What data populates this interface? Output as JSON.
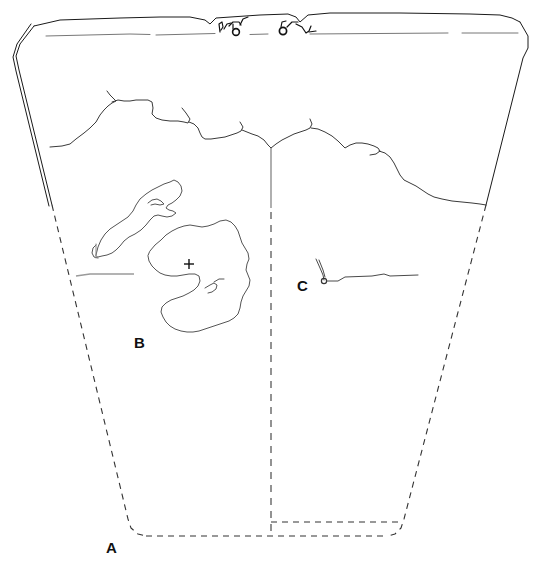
{
  "figure": {
    "type": "archaeological-section-drawing",
    "title": "",
    "background_color": "#ffffff",
    "width": 536,
    "height": 566,
    "line_color": "#1a1a1a",
    "faint_line_color": "#808080",
    "dashed_line_color": "#333333"
  },
  "labels": [
    {
      "id": "label-a",
      "text": "A",
      "x": 106,
      "y": 553
    },
    {
      "id": "label-b",
      "text": "B",
      "x": 134,
      "y": 348
    },
    {
      "id": "label-c",
      "text": "C",
      "x": 297,
      "y": 291
    }
  ],
  "markers": [
    {
      "id": "center-cross",
      "symbol": "+",
      "x": 189,
      "y": 264
    }
  ],
  "regions": [
    {
      "id": "trench-outline",
      "style": "solid-upper-dashed-lower",
      "description": "trapezoidal trench section outline"
    },
    {
      "id": "upper-band",
      "style": "solid",
      "description": "topsoil band with faint horizontal lines"
    },
    {
      "id": "stratum-boundary",
      "style": "solid",
      "description": "irregular jagged stratigraphic contact line"
    },
    {
      "id": "feature-b-outline",
      "style": "solid",
      "description": "irregular closed feature outline labelled B"
    },
    {
      "id": "feature-c-line",
      "style": "solid",
      "description": "thin horizontal feature with hook labelled C"
    },
    {
      "id": "baulk-centre-line",
      "style": "solid-then-dashed",
      "description": "vertical centre line"
    },
    {
      "id": "trench-base",
      "style": "dashed",
      "description": "projected trench base"
    },
    {
      "id": "sump-step",
      "style": "dashed",
      "description": "dashed rectangular step at base right"
    }
  ],
  "sketch_marks": [
    {
      "id": "sketch-mark-left",
      "description": "small dark scribble glyph on topsoil line",
      "x": 228,
      "y": 30
    },
    {
      "id": "sketch-mark-right",
      "description": "small dark scribble glyph on topsoil line",
      "x": 285,
      "y": 30
    }
  ]
}
